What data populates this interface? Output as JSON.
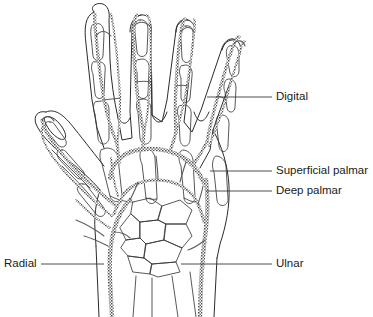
{
  "figure": {
    "background_color": "#ffffff",
    "ink_color": "#2b2b2b",
    "artery_color": "#5c5c5c",
    "leader_color": "#3a3a3a"
  },
  "labels": [
    {
      "id": "digital",
      "text": "Digital",
      "side": "right",
      "text_x": 276,
      "text_y": 97,
      "leader": "M 207 97 L 272 97"
    },
    {
      "id": "superficial-palmar",
      "text": "Superficial palmar",
      "side": "right",
      "text_x": 276,
      "text_y": 171,
      "leader": "M 210 171 L 272 171"
    },
    {
      "id": "deep-palmar",
      "text": "Deep palmar",
      "side": "right",
      "text_x": 276,
      "text_y": 191,
      "leader": "M 206 191 L 272 191"
    },
    {
      "id": "radial",
      "text": "Radial",
      "side": "left",
      "text_x": 4,
      "text_y": 264,
      "leader": "M 41 264 L 104 264"
    },
    {
      "id": "ulnar",
      "text": "Ulnar",
      "side": "right",
      "text_x": 276,
      "text_y": 264,
      "leader": "M 181 264 L 272 264"
    }
  ],
  "anatomy": {
    "view": "palmar view of right hand skeleton with arteries",
    "structures": [
      "index finger",
      "middle finger",
      "ring finger",
      "little finger",
      "thumb",
      "metacarpals",
      "carpal bones",
      "radius",
      "ulna"
    ],
    "vessels": [
      "radial artery",
      "ulnar artery",
      "superficial palmar arch",
      "deep palmar arch",
      "common palmar digital arteries",
      "proper palmar digital arteries",
      "princeps pollicis artery"
    ]
  }
}
